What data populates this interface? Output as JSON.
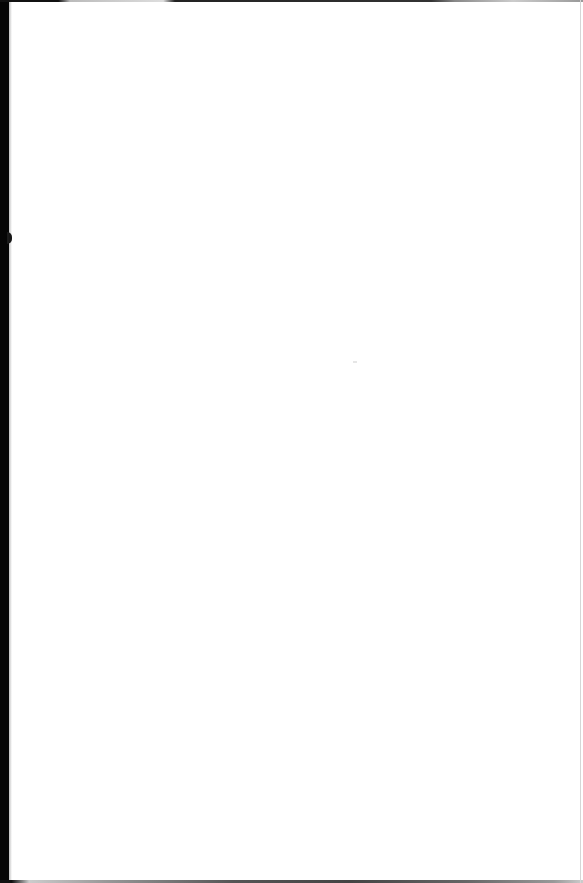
{
  "document": {
    "type": "scanned-page",
    "content": "",
    "colors": {
      "page": "#ffffff",
      "binding_edge": "#050505",
      "right_edge": "#d6d6d6"
    }
  }
}
